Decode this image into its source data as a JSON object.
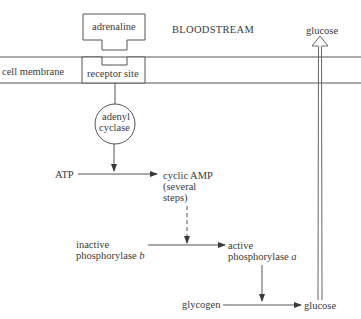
{
  "diagram": {
    "type": "biochemical-pathway",
    "regions": {
      "bloodstream": "BLOODSTREAM",
      "cell_membrane": "cell membrane"
    },
    "nodes": {
      "adrenaline": "adrenaline",
      "receptor_site": "receptor site",
      "adenyl_cyclase_line1": "adenyl",
      "adenyl_cyclase_line2": "cyclase",
      "atp": "ATP",
      "cyclic_amp_line1": "cyclic AMP",
      "cyclic_amp_line2": "(several",
      "cyclic_amp_line3": "steps)",
      "inactive_phosphorylase_line1": "inactive",
      "inactive_phosphorylase_line2": "phosphorylase",
      "inactive_phosphorylase_suffix": "b",
      "active_phosphorylase_line1": "active",
      "active_phosphorylase_line2": "phosphorylase",
      "active_phosphorylase_suffix": "a",
      "glycogen": "glycogen",
      "glucose_cell": "glucose",
      "glucose_blood": "glucose"
    },
    "edges": [
      {
        "from": "adrenaline",
        "to": "receptor_site",
        "style": "binding"
      },
      {
        "from": "receptor_site",
        "to": "adenyl_cyclase",
        "style": "line"
      },
      {
        "from": "adenyl_cyclase",
        "to": "ATP->cyclic AMP",
        "style": "catalyses"
      },
      {
        "from": "ATP",
        "to": "cyclic AMP",
        "style": "arrow"
      },
      {
        "from": "cyclic AMP",
        "to": "inactive->active phosphorylase",
        "style": "dashed-arrow"
      },
      {
        "from": "inactive phosphorylase b",
        "to": "active phosphorylase a",
        "style": "arrow"
      },
      {
        "from": "active phosphorylase a",
        "to": "glycogen->glucose",
        "style": "catalyses"
      },
      {
        "from": "glycogen",
        "to": "glucose",
        "style": "arrow"
      },
      {
        "from": "glucose",
        "to": "bloodstream glucose",
        "style": "hollow-arrow"
      }
    ]
  }
}
